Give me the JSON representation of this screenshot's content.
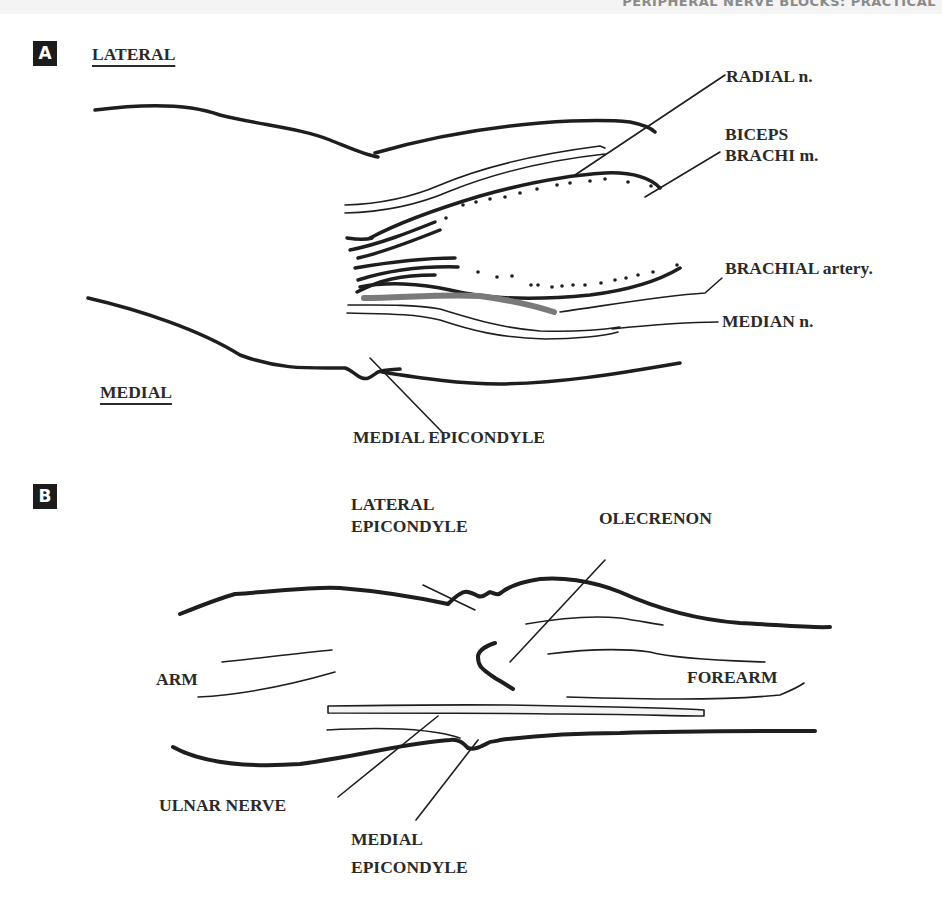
{
  "page": {
    "running_header": "PERIPHERAL NERVE BLOCKS: PRACTICAL",
    "colors": {
      "ink": "#1e1e1e",
      "label": "#2a2a2a",
      "artery": "#7a7a7a",
      "badge_bg": "#1c1c1c"
    }
  },
  "panel_a": {
    "badge": "A",
    "orientation_top": "LATERAL",
    "orientation_bottom": "MEDIAL",
    "labels": {
      "radial_nerve": "RADIAL n.",
      "biceps_line1": "BICEPS",
      "biceps_line2": "BRACHI m.",
      "brachial_artery": "BRACHIAL artery.",
      "median_nerve": "MEDIAN n.",
      "medial_epicondyle": "MEDIAL EPICONDYLE"
    }
  },
  "panel_b": {
    "badge": "B",
    "labels": {
      "lateral_epicondyle_line1": "LATERAL",
      "lateral_epicondyle_line2": "EPICONDYLE",
      "olecranon": "OLECRENON",
      "arm": "ARM",
      "forearm": "FOREARM",
      "ulnar_nerve": "ULNAR NERVE",
      "medial_epicondyle_line1": "MEDIAL",
      "medial_epicondyle_line2": "EPICONDYLE"
    }
  }
}
